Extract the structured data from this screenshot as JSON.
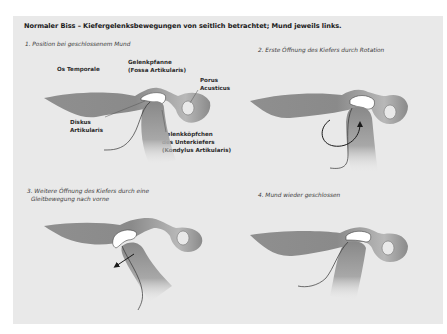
{
  "title": "Normaler Biss – Kiefergelenksbewegungen von seitlich betrachtet; Mund jeweils links.",
  "colors": {
    "panel_background": "#e9e9e9",
    "bone": "#8a8a8a",
    "bone_highlight": "#b5b5b5",
    "disc": "#ffffff",
    "outline": "#333333",
    "arrow": "#1a1a1a"
  },
  "panels": [
    {
      "caption_lines": [
        "1. Position bei geschlossenem Mund"
      ],
      "labels": {
        "os_temporale": [
          "Os Temporale"
        ],
        "gelenkpfanne": [
          "Gelenkpfanne",
          "(Fossa Artikularis)"
        ],
        "porus": [
          "Porus",
          "Acusticus"
        ],
        "diskus": [
          "Diskus",
          "Artikularis"
        ],
        "gelenkkoepfchen": [
          "Gelenkköpfchen",
          "des Unterkiefers",
          "(Kondylus Artikularis)"
        ]
      },
      "arrow": "none"
    },
    {
      "caption_lines": [
        "2. Erste Öffnung des Kiefers durch Rotation"
      ],
      "arrow": "rotation-arrow"
    },
    {
      "caption_lines": [
        "3. Weitere Öffnung des Kiefers durch eine",
        "Gleitbewegung nach vorne"
      ],
      "arrow": "forward-slide-arrow"
    },
    {
      "caption_lines": [
        "4. Mund wieder geschlossen"
      ],
      "arrow": "none"
    }
  ]
}
